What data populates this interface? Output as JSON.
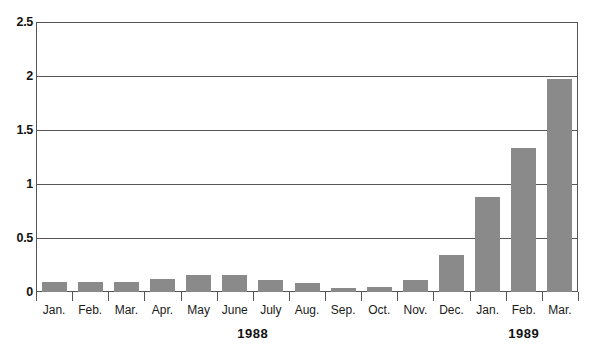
{
  "chart_data": {
    "type": "bar",
    "title": "",
    "subtitle": "",
    "xlabel": "",
    "ylabel": "",
    "categories": [
      "Jan.",
      "Feb.",
      "Mar.",
      "Apr.",
      "May",
      "June",
      "July",
      "Aug.",
      "Sep.",
      "Oct.",
      "Nov.",
      "Dec.",
      "Jan.",
      "Feb.",
      "Mar."
    ],
    "values": [
      0.09,
      0.09,
      0.09,
      0.12,
      0.16,
      0.16,
      0.11,
      0.08,
      0.04,
      0.05,
      0.11,
      0.34,
      0.88,
      1.33,
      1.97
    ],
    "series": [
      {
        "name": "",
        "values": [
          0.09,
          0.09,
          0.09,
          0.12,
          0.16,
          0.16,
          0.11,
          0.08,
          0.04,
          0.05,
          0.11,
          0.34,
          0.88,
          1.33,
          1.97
        ]
      }
    ],
    "ylim": [
      0,
      2.5
    ],
    "yticks": [
      0,
      0.5,
      1,
      1.5,
      2,
      2.5
    ],
    "ytick_labels": [
      "0",
      "0.5",
      "1",
      "1.5",
      "2",
      "2.5"
    ],
    "grid": true,
    "grid_axis": "y",
    "legend": false,
    "legend_position": "none",
    "bar_color": "#8a8a8a",
    "axis_color": "#555555",
    "groups": [
      {
        "label": "1988",
        "start_index": 0,
        "end_index": 11
      },
      {
        "label": "1989",
        "start_index": 12,
        "end_index": 14
      }
    ]
  }
}
